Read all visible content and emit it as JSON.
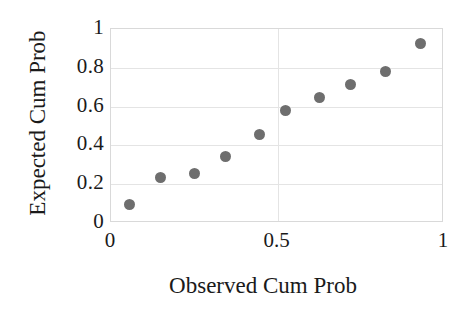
{
  "chart_data": {
    "type": "scatter",
    "title": "",
    "xlabel": "Observed Cum Prob",
    "ylabel": "Expected Cum Prob",
    "xlim": [
      0,
      1
    ],
    "ylim": [
      0,
      1
    ],
    "xticks": [
      "0",
      "0.5",
      "1"
    ],
    "xtick_values": [
      0,
      0.5,
      1
    ],
    "yticks": [
      "0",
      "0.2",
      "0.4",
      "0.6",
      "0.8",
      "1"
    ],
    "ytick_values": [
      0,
      0.2,
      0.4,
      0.6,
      0.8,
      1
    ],
    "grid": "horizontal-and-vertical-light",
    "legend": "none",
    "marker": {
      "shape": "circle",
      "color": "#6e6e6e",
      "size_px": 11
    },
    "points": [
      {
        "x": 0.055,
        "y": 0.095
      },
      {
        "x": 0.15,
        "y": 0.235
      },
      {
        "x": 0.25,
        "y": 0.255
      },
      {
        "x": 0.345,
        "y": 0.345
      },
      {
        "x": 0.445,
        "y": 0.455
      },
      {
        "x": 0.525,
        "y": 0.58
      },
      {
        "x": 0.625,
        "y": 0.645
      },
      {
        "x": 0.72,
        "y": 0.715
      },
      {
        "x": 0.825,
        "y": 0.78
      },
      {
        "x": 0.93,
        "y": 0.925
      }
    ],
    "series": [
      {
        "name": "Normal P-P Plot",
        "x": [
          0.055,
          0.15,
          0.25,
          0.345,
          0.445,
          0.525,
          0.625,
          0.72,
          0.825,
          0.93
        ],
        "values": [
          0.095,
          0.235,
          0.255,
          0.345,
          0.455,
          0.58,
          0.645,
          0.715,
          0.78,
          0.925
        ]
      }
    ]
  },
  "colors": {
    "marker": "#6e6e6e",
    "gridline": "#e4e4e4",
    "plot_border": "#d9d9d9",
    "text": "#1a1a1a",
    "background": "#ffffff"
  }
}
